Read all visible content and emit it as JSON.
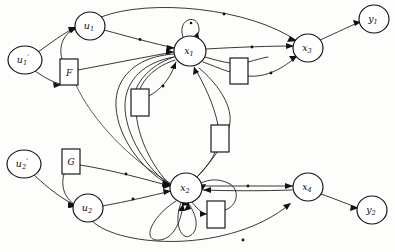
{
  "diagram": {
    "type": "directed-graph",
    "canvas": {
      "width": 395,
      "height": 252,
      "background": "#fdfdfb"
    },
    "stroke_color": "#141414",
    "node_fill": "#ffffff",
    "nodes": [
      {
        "id": "u1p",
        "label": "u",
        "sub": "1",
        "prime": true,
        "cx": 25,
        "cy": 60,
        "r": 14,
        "kind": "input-source"
      },
      {
        "id": "u1",
        "label": "u",
        "sub": "1",
        "prime": false,
        "cx": 90,
        "cy": 26,
        "r": 14,
        "kind": "input"
      },
      {
        "id": "x1",
        "label": "x",
        "sub": "1",
        "prime": false,
        "cx": 190,
        "cy": 51,
        "r": 16,
        "kind": "state"
      },
      {
        "id": "x3",
        "label": "x",
        "sub": "3",
        "prime": false,
        "cx": 308,
        "cy": 48,
        "r": 15,
        "kind": "state"
      },
      {
        "id": "y1",
        "label": "y",
        "sub": "1",
        "prime": false,
        "cx": 374,
        "cy": 19,
        "r": 14,
        "kind": "output"
      },
      {
        "id": "u2p",
        "label": "u",
        "sub": "2",
        "prime": true,
        "cx": 24,
        "cy": 164,
        "r": 14,
        "kind": "input-source"
      },
      {
        "id": "u2",
        "label": "u",
        "sub": "2",
        "prime": false,
        "cx": 88,
        "cy": 208,
        "r": 14,
        "kind": "input"
      },
      {
        "id": "x2",
        "label": "x",
        "sub": "2",
        "prime": false,
        "cx": 186,
        "cy": 188,
        "r": 16,
        "kind": "state"
      },
      {
        "id": "x4",
        "label": "x",
        "sub": "4",
        "prime": false,
        "cx": 308,
        "cy": 187,
        "r": 15,
        "kind": "state"
      },
      {
        "id": "y2",
        "label": "y",
        "sub": "2",
        "prime": false,
        "cx": 372,
        "cy": 210,
        "r": 14,
        "kind": "output"
      }
    ],
    "boxes": [
      {
        "id": "boxF",
        "label": "F",
        "x": 60,
        "y": 59,
        "w": 18,
        "h": 26
      },
      {
        "id": "boxG",
        "label": "G",
        "x": 62,
        "y": 149,
        "w": 18,
        "h": 25
      },
      {
        "id": "box1",
        "label": "",
        "x": 230,
        "y": 58,
        "w": 18,
        "h": 26
      },
      {
        "id": "box2",
        "label": "",
        "x": 131,
        "y": 89,
        "w": 18,
        "h": 27
      },
      {
        "id": "box3",
        "label": "",
        "x": 211,
        "y": 125,
        "w": 18,
        "h": 27
      },
      {
        "id": "box4",
        "label": "",
        "x": 207,
        "y": 201,
        "w": 18,
        "h": 27
      }
    ],
    "edge_count": 28,
    "self_loops": [
      {
        "at": "x1",
        "count": 1,
        "direction": "up"
      },
      {
        "at": "x2",
        "count": 3,
        "direction": "down"
      }
    ]
  }
}
